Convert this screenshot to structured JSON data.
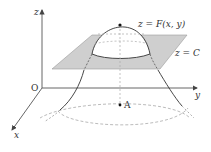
{
  "diagram": {
    "axes": {
      "z_label": "z",
      "y_label": "y",
      "x_label": "x",
      "origin_label": "O"
    },
    "surface_label": "z = F(x, y)",
    "plane_label": "z = C",
    "point_label": "A",
    "colors": {
      "plane_fill": "#cfcfcf",
      "plane_stroke": "#9a9a9a",
      "axis": "#555555",
      "curve": "#333333",
      "dashed": "#9a9a9a"
    }
  }
}
